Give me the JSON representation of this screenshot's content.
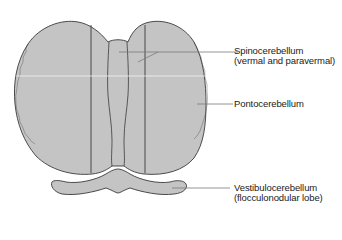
{
  "diagram": {
    "colors": {
      "tissue_fill": "#c4c4c4",
      "outline": "#3a3a3a",
      "leader_line": "#7a7a7a",
      "text": "#1a1a1a",
      "background": "#ffffff"
    },
    "labels": [
      {
        "id": "spinocerebellum",
        "line1": "Spinocerebellum",
        "line2": "(vermal and paravermal)"
      },
      {
        "id": "pontocerebellum",
        "line1": "Pontocerebellum"
      },
      {
        "id": "vestibulocerebellum",
        "line1": "Vestibulocerebellum",
        "line2": "(flocculonodular lobe)"
      }
    ]
  }
}
